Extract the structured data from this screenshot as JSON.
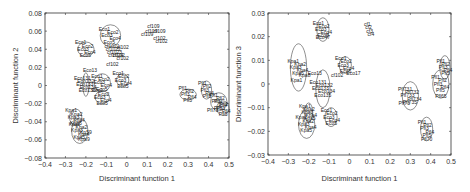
{
  "chart_data": [
    {
      "type": "scatter",
      "title": "",
      "xlabel": "Discriminant function 1",
      "ylabel": "Discriminant function 2",
      "xlim": [
        -0.4,
        0.5
      ],
      "ylim": [
        -0.08,
        0.08
      ],
      "xticks": [
        "-0.4",
        "-0.3",
        "-0.2",
        "-0.1",
        "0",
        "0.1",
        "0.2",
        "0.3",
        "0.4",
        "0.5"
      ],
      "yticks": [
        "0.08",
        "0.06",
        "0.04",
        "0.02",
        "0",
        "-0.02",
        "-0.04",
        "-0.06",
        "-0.08"
      ],
      "grid": false,
      "legend": "none",
      "clusters": [
        {
          "label": "Eco",
          "cx": -0.08,
          "cy": 0.055,
          "rx": 0.05,
          "ry": 0.012
        },
        {
          "label": "cf102",
          "cx": -0.06,
          "cy": 0.038,
          "rx": 0.0,
          "ry": 0.0
        },
        {
          "label": "Eco",
          "cx": -0.2,
          "cy": 0.04,
          "rx": 0.04,
          "ry": 0.008
        },
        {
          "label": "Eco13",
          "cx": -0.2,
          "cy": 0.001,
          "rx": 0.015,
          "ry": 0.013
        },
        {
          "label": "Eco",
          "cx": -0.12,
          "cy": 0.003,
          "rx": 0.04,
          "ry": 0.01
        },
        {
          "label": "Eco",
          "cx": -0.02,
          "cy": 0.006,
          "rx": 0.03,
          "ry": 0.007
        },
        {
          "label": "Eco",
          "cx": -0.12,
          "cy": -0.013,
          "rx": 0.035,
          "ry": 0.007
        },
        {
          "label": "Kpa",
          "cx": -0.25,
          "cy": -0.035,
          "rx": 0.03,
          "ry": 0.009
        },
        {
          "label": "Kpa",
          "cx": -0.23,
          "cy": -0.05,
          "rx": 0.04,
          "ry": 0.014
        },
        {
          "label": "Pfl",
          "cx": 0.3,
          "cy": -0.01,
          "rx": 0.04,
          "ry": 0.006
        },
        {
          "label": "Pfl",
          "cx": 0.39,
          "cy": -0.005,
          "rx": 0.025,
          "ry": 0.01
        },
        {
          "label": "Pfl",
          "cx": 0.45,
          "cy": -0.018,
          "rx": 0.04,
          "ry": 0.01
        },
        {
          "label": "Pfl",
          "cx": 0.47,
          "cy": -0.025,
          "rx": 0.03,
          "ry": 0.008
        }
      ],
      "point_labels": [
        {
          "text": "cf109",
          "x": 0.13,
          "y": 0.064
        },
        {
          "text": "cf109",
          "x": 0.12,
          "y": 0.058
        },
        {
          "text": "cf109",
          "x": 0.16,
          "y": 0.058
        },
        {
          "text": "cf109",
          "x": 0.1,
          "y": 0.055
        },
        {
          "text": "cf102",
          "x": 0.16,
          "y": 0.05
        },
        {
          "text": "cf102",
          "x": 0.17,
          "y": 0.047
        },
        {
          "text": "cf102",
          "x": -0.02,
          "y": 0.04
        },
        {
          "text": "cf102",
          "x": -0.04,
          "y": 0.032
        },
        {
          "text": "cf102",
          "x": -0.02,
          "y": 0.028
        },
        {
          "text": "cf102",
          "x": -0.07,
          "y": 0.022
        },
        {
          "text": "Eco13",
          "x": -0.18,
          "y": 0.015
        },
        {
          "text": "Kpa9",
          "x": -0.21,
          "y": -0.061
        },
        {
          "text": "Kp59",
          "x": -0.2,
          "y": -0.053
        },
        {
          "text": "Pfl73",
          "x": 0.42,
          "y": -0.029
        }
      ]
    },
    {
      "type": "scatter",
      "title": "",
      "xlabel": "Discriminant function 1",
      "ylabel": "Discriminant function 3",
      "xlim": [
        -0.4,
        0.5
      ],
      "ylim": [
        -0.03,
        0.03
      ],
      "xticks": [
        "-0.4",
        "-0.3",
        "-0.2",
        "-0.1",
        "0",
        "0.1",
        "0.2",
        "0.3",
        "0.4",
        "0.5"
      ],
      "yticks": [
        "0.03",
        "0.02",
        "0.01",
        "0",
        "-0.01",
        "-0.02",
        "-0.03"
      ],
      "grid": false,
      "legend": "none",
      "clusters": [
        {
          "label": "Eco",
          "cx": -0.13,
          "cy": 0.023,
          "rx": 0.03,
          "ry": 0.005
        },
        {
          "label": "cf",
          "cx": 0.1,
          "cy": 0.023,
          "rx": 0.0,
          "ry": 0.0
        },
        {
          "label": "Kpa",
          "cx": -0.25,
          "cy": 0.007,
          "rx": 0.04,
          "ry": 0.01
        },
        {
          "label": "Eco",
          "cx": -0.02,
          "cy": 0.008,
          "rx": 0.03,
          "ry": 0.0035
        },
        {
          "label": "Eco13",
          "cx": -0.13,
          "cy": -0.002,
          "rx": 0.035,
          "ry": 0.008
        },
        {
          "label": "Kpa",
          "cx": -0.2,
          "cy": -0.012,
          "rx": 0.02,
          "ry": 0.004
        },
        {
          "label": "Kpa",
          "cx": -0.21,
          "cy": -0.017,
          "rx": 0.04,
          "ry": 0.006
        },
        {
          "label": "Eco",
          "cx": -0.09,
          "cy": -0.014,
          "rx": 0.03,
          "ry": 0.004
        },
        {
          "label": "Pfl73",
          "cx": 0.3,
          "cy": -0.005,
          "rx": 0.04,
          "ry": 0.006
        },
        {
          "label": "Pfl",
          "cx": 0.38,
          "cy": -0.019,
          "rx": 0.03,
          "ry": 0.005
        },
        {
          "label": "Pfl",
          "cx": 0.47,
          "cy": 0.007,
          "rx": 0.025,
          "ry": 0.005
        },
        {
          "label": "Pfl",
          "cx": 0.45,
          "cy": 0.0,
          "rx": 0.04,
          "ry": 0.006
        }
      ],
      "point_labels": [
        {
          "text": "Eco47",
          "x": -0.13,
          "y": 0.019
        },
        {
          "text": "Eco13",
          "x": -0.17,
          "y": 0.004
        },
        {
          "text": "cf102",
          "x": -0.06,
          "y": 0.003
        },
        {
          "text": "Eco17",
          "x": 0.02,
          "y": 0.004
        },
        {
          "text": "Kpa8",
          "x": -0.22,
          "y": 0.003
        },
        {
          "text": "Kpa1",
          "x": -0.26,
          "y": 0.001
        },
        {
          "text": "Pfl73",
          "x": 0.27,
          "y": -0.009
        },
        {
          "text": "Pfl70",
          "x": 0.38,
          "y": -0.024
        },
        {
          "text": "Pfl65",
          "x": 0.45,
          "y": -0.006
        }
      ]
    }
  ]
}
